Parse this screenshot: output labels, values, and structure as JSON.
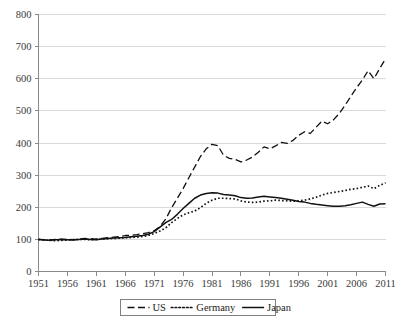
{
  "chart_data": {
    "type": "line",
    "title": "",
    "subtitle": "",
    "xlabel": "",
    "ylabel": "",
    "xlim": [
      1951,
      2011
    ],
    "ylim": [
      0,
      800
    ],
    "grid": true,
    "legend_position": "bottom-center",
    "y_ticks": [
      "0",
      "100",
      "200",
      "300",
      "400",
      "500",
      "600",
      "700",
      "800"
    ],
    "y_tick_values": [
      0,
      100,
      200,
      300,
      400,
      500,
      600,
      700,
      800
    ],
    "x_ticks": [
      "1951",
      "1956",
      "1961",
      "1966",
      "1971",
      "1976",
      "1981",
      "1986",
      "1991",
      "1996",
      "2001",
      "2006",
      "2011"
    ],
    "x_tick_values": [
      1951,
      1956,
      1961,
      1966,
      1971,
      1976,
      1981,
      1986,
      1991,
      1996,
      2001,
      2006,
      2011
    ],
    "x": [
      1951,
      1952,
      1953,
      1954,
      1955,
      1956,
      1957,
      1958,
      1959,
      1960,
      1961,
      1962,
      1963,
      1964,
      1965,
      1966,
      1967,
      1968,
      1969,
      1970,
      1971,
      1972,
      1973,
      1974,
      1975,
      1976,
      1977,
      1978,
      1979,
      1980,
      1981,
      1982,
      1983,
      1984,
      1985,
      1986,
      1987,
      1988,
      1989,
      1990,
      1991,
      1992,
      1993,
      1994,
      1995,
      1996,
      1997,
      1998,
      1999,
      2000,
      2001,
      2002,
      2003,
      2004,
      2005,
      2006,
      2007,
      2008,
      2009,
      2010,
      2011
    ],
    "series": [
      {
        "name": "US",
        "style": "dashed",
        "color": "#111111",
        "values": [
          100,
          99,
          98,
          100,
          101,
          100,
          99,
          101,
          103,
          102,
          101,
          103,
          105,
          107,
          109,
          112,
          113,
          115,
          118,
          121,
          127,
          140,
          163,
          198,
          228,
          258,
          292,
          325,
          358,
          382,
          396,
          392,
          362,
          352,
          349,
          341,
          347,
          356,
          371,
          388,
          382,
          391,
          402,
          399,
          408,
          424,
          435,
          430,
          449,
          468,
          460,
          472,
          492,
          517,
          545,
          572,
          596,
          625,
          600,
          632,
          662
        ]
      },
      {
        "name": "Germany",
        "style": "dotted",
        "color": "#111111",
        "values": [
          100,
          98,
          97,
          96,
          97,
          98,
          99,
          100,
          100,
          99,
          100,
          101,
          102,
          103,
          104,
          105,
          106,
          107,
          109,
          112,
          118,
          126,
          136,
          152,
          165,
          176,
          183,
          188,
          199,
          212,
          222,
          228,
          228,
          227,
          226,
          220,
          216,
          215,
          216,
          219,
          220,
          222,
          221,
          220,
          219,
          220,
          222,
          226,
          231,
          238,
          243,
          246,
          249,
          252,
          256,
          258,
          262,
          266,
          258,
          268,
          276
        ]
      },
      {
        "name": "Japan",
        "style": "solid",
        "color": "#111111",
        "values": [
          100,
          98,
          97,
          99,
          100,
          99,
          98,
          100,
          101,
          100,
          99,
          101,
          103,
          104,
          105,
          106,
          108,
          110,
          112,
          116,
          124,
          138,
          152,
          162,
          178,
          196,
          212,
          228,
          238,
          243,
          245,
          244,
          240,
          238,
          236,
          230,
          228,
          229,
          232,
          234,
          232,
          230,
          228,
          225,
          222,
          218,
          216,
          212,
          209,
          207,
          205,
          203,
          203,
          205,
          208,
          212,
          216,
          209,
          203,
          210,
          211
        ]
      }
    ]
  },
  "legend": {
    "items": [
      {
        "label": "US",
        "style": "dashed"
      },
      {
        "label": "Germany",
        "style": "dotted"
      },
      {
        "label": "Japan",
        "style": "solid"
      }
    ]
  }
}
